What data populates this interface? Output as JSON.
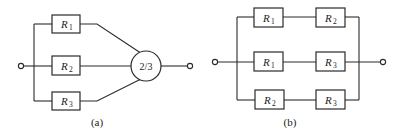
{
  "diagram_a": {
    "caption": "(a)",
    "voter_label": "2/3",
    "resistors": [
      {
        "letter": "R",
        "sub": "1"
      },
      {
        "letter": "R",
        "sub": "2"
      },
      {
        "letter": "R",
        "sub": "3"
      }
    ]
  },
  "diagram_b": {
    "caption": "(b)",
    "rows": [
      [
        {
          "letter": "R",
          "sub": "1"
        },
        {
          "letter": "R",
          "sub": "2"
        }
      ],
      [
        {
          "letter": "R",
          "sub": "1"
        },
        {
          "letter": "R",
          "sub": "3"
        }
      ],
      [
        {
          "letter": "R",
          "sub": "2"
        },
        {
          "letter": "R",
          "sub": "3"
        }
      ]
    ]
  }
}
